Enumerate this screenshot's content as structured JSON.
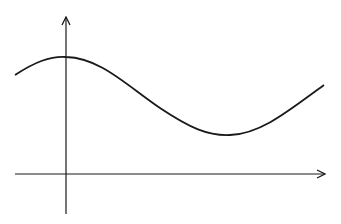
{
  "diagram": {
    "type": "function-graph",
    "colors": {
      "background": "#ffffff",
      "stroke": "#1a1a1a"
    },
    "axes": {
      "x_axis": {
        "y": 174,
        "x_start": 15,
        "x_end": 325,
        "arrow": "right"
      },
      "y_axis": {
        "x": 66,
        "y_start": 214,
        "y_end": 17,
        "arrow": "up"
      }
    },
    "curve": {
      "points": [
        [
          15,
          75
        ],
        [
          66,
          57
        ],
        [
          147,
          96
        ],
        [
          228,
          135
        ],
        [
          324,
          85
        ]
      ],
      "path": "M15,75 C35,62 50,56 66,57 C100,58 125,84 160,108 C190,128 208,136 230,135 C262,134 292,108 324,85"
    }
  }
}
